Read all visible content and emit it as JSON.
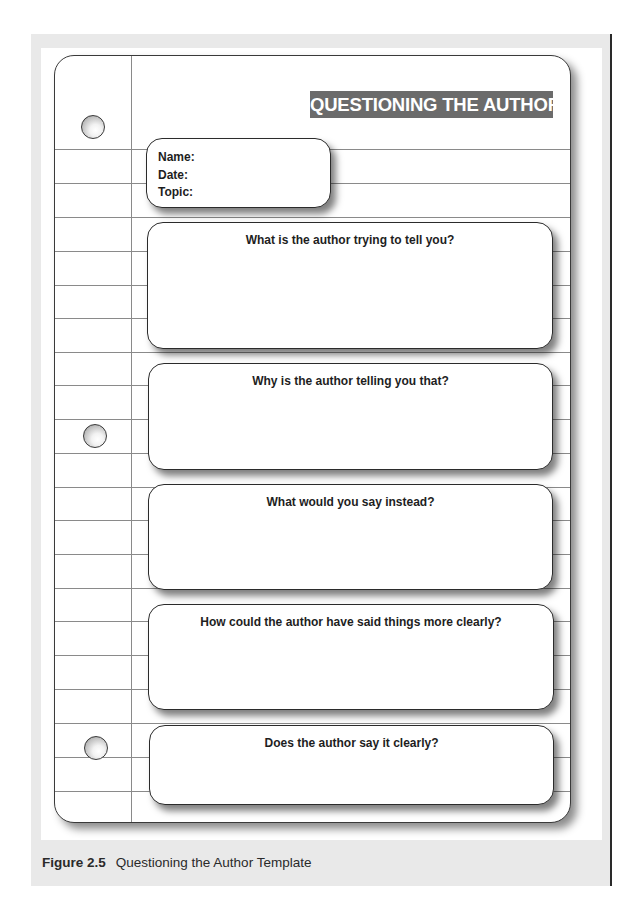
{
  "template": {
    "title": "QUESTIONING THE AUTHOR",
    "title_banner_color": "#6b6b6b",
    "id_fields": [
      {
        "label": "Name:"
      },
      {
        "label": "Date:"
      },
      {
        "label": "Topic:"
      }
    ],
    "questions": [
      {
        "label": "What is the author trying to tell you?"
      },
      {
        "label": "Why is the author telling you that?"
      },
      {
        "label": "What would you say instead?"
      },
      {
        "label": "How could the author have said things more clearly?"
      },
      {
        "label": "Does the author say it clearly?"
      }
    ],
    "decorations": {
      "binder_holes": 3,
      "ruled_lines": 20
    }
  },
  "caption": {
    "figure_number": "Figure 2.5",
    "text": "Questioning the Author Template"
  }
}
